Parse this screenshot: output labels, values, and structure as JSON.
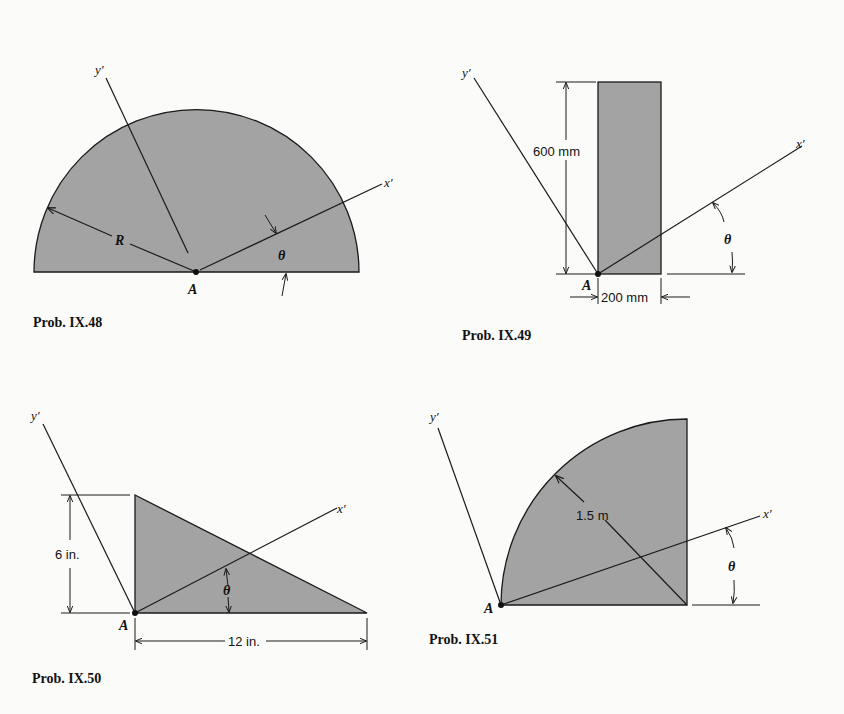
{
  "figures": [
    {
      "caption": "Prob. IX.48",
      "shape": "semicircle",
      "labels": {
        "x_axis": "x′",
        "y_axis": "y′",
        "point": "A",
        "radius": "R",
        "angle": "θ"
      }
    },
    {
      "caption": "Prob. IX.49",
      "shape": "rectangle",
      "labels": {
        "x_axis": "x′",
        "y_axis": "y′",
        "point": "A",
        "height": "600 mm",
        "width": "200 mm",
        "angle": "θ"
      }
    },
    {
      "caption": "Prob. IX.50",
      "shape": "right-triangle",
      "labels": {
        "x_axis": "x′",
        "y_axis": "y′",
        "point": "A",
        "height": "6 in.",
        "base": "12 in.",
        "angle": "θ"
      }
    },
    {
      "caption": "Prob. IX.51",
      "shape": "quarter-circle",
      "labels": {
        "x_axis": "x′",
        "y_axis": "y′",
        "point": "A",
        "radius": "1.5 m",
        "angle": "θ"
      }
    }
  ],
  "colors": {
    "fill": "#a3a3a3",
    "stroke": "#1a1a1a",
    "background": "#fbfbfa"
  }
}
